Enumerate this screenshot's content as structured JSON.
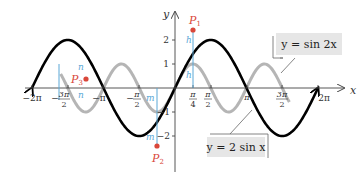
{
  "chart_data": {
    "type": "line",
    "title": "",
    "xlabel": "x",
    "ylabel": "y",
    "xlim": [
      -6.2832,
      6.2832
    ],
    "ylim": [
      -2,
      2
    ],
    "grid": false,
    "x_tick_labels": [
      "−2π",
      "−3π/2",
      "−π",
      "−π/2",
      "π/4",
      "π/2",
      "π",
      "3π/2",
      "2π"
    ],
    "y_tick_labels": [
      "2",
      "1",
      "−1",
      "−2"
    ],
    "series": [
      {
        "name": "y = 2 sin x",
        "function": "2*sin(x)",
        "color": "#000000",
        "style": "thick"
      },
      {
        "name": "y = sin 2x",
        "function": "sin(2*x)",
        "color": "#b3b3b3",
        "style": "thick"
      }
    ],
    "points": [
      {
        "label": "P1",
        "x": 0.7854,
        "y": 2.414,
        "note": "sum at x = π/4, h + h"
      },
      {
        "label": "P2",
        "x": -0.7854,
        "y": -2.414,
        "note": "sum at x = −π/4, m + m"
      },
      {
        "label": "P3",
        "x": -3.927,
        "y": 0.414,
        "note": "sum at x = −5π/4, n + n"
      }
    ],
    "segment_labels": [
      "h",
      "h",
      "m",
      "m",
      "n",
      "n"
    ],
    "callouts": [
      "y = sin 2x",
      "y = 2 sin x"
    ]
  },
  "axes": {
    "x_label": "x",
    "y_label": "y",
    "x_ticks": {
      "neg_2pi": "−2π",
      "neg_3pi2_num": "3π",
      "neg_3pi2_den": "2",
      "neg_pi": "−π",
      "neg_pi2_num": "π",
      "neg_pi2_den": "2",
      "pi4_num": "π",
      "pi4_den": "4",
      "pi2_num": "π",
      "pi2_den": "2",
      "pi": "π",
      "three_pi2_num": "3π",
      "three_pi2_den": "2",
      "two_pi": "2π",
      "minus": "−"
    },
    "y_ticks": {
      "two": "2",
      "one": "1",
      "neg_one": "−1",
      "neg_two": "−2"
    }
  },
  "points": {
    "p1": {
      "letter": "P",
      "sub": "1"
    },
    "p2": {
      "letter": "P",
      "sub": "2"
    },
    "p3": {
      "letter": "P",
      "sub": "3"
    }
  },
  "segments": {
    "h": "h",
    "m": "m",
    "n": "n"
  },
  "callouts": {
    "sin2x": "y = sin 2x",
    "twosinx": "y = 2 sin x"
  },
  "colors": {
    "curve_main": "#000000",
    "curve_secondary": "#b5b5b5",
    "point": "#d9473a",
    "segment": "#5aa7d6",
    "callout_bg": "#e6e6e6",
    "axis": "#444444"
  }
}
